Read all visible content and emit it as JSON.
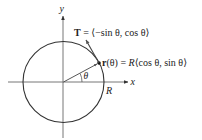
{
  "diagram": {
    "axes": {
      "x_label": "x",
      "y_label": "y"
    },
    "circle": {
      "radius_label": "R"
    },
    "angle_label": "θ",
    "tangent_vector": {
      "symbol": "T",
      "equals": " = ",
      "expression": "⟨−sin θ, cos θ⟩"
    },
    "position_vector": {
      "symbol": "r",
      "argument": "(θ)",
      "equals": " = ",
      "coefficient": "R",
      "expression": "⟨cos θ, sin θ⟩"
    },
    "colors": {
      "stroke": "#333333",
      "axis": "#555555",
      "background": "#ffffff"
    }
  }
}
